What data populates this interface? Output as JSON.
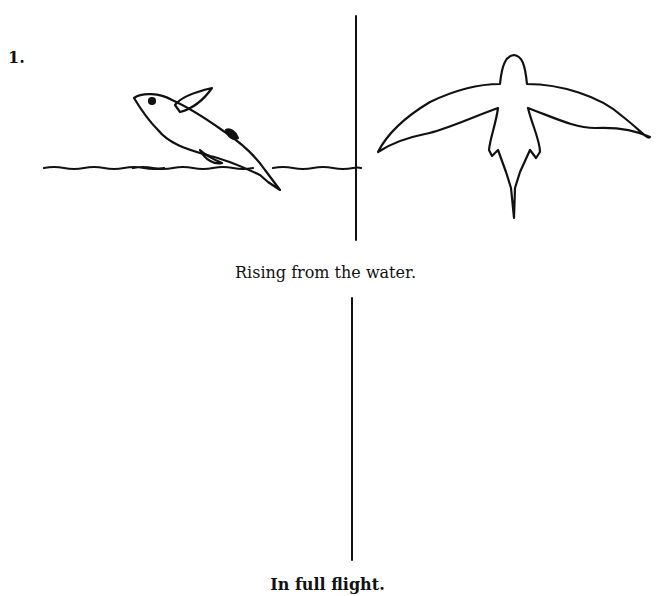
{
  "figure": {
    "number": "1.",
    "panels": [
      {
        "caption": "Rising from the water.",
        "side_view": "flying-fish-side-rising",
        "top_view": "flying-fish-top-rising"
      },
      {
        "caption": "In full flight.",
        "side_view": "flying-fish-side-flight",
        "top_view": "flying-fish-top-flight"
      }
    ]
  }
}
